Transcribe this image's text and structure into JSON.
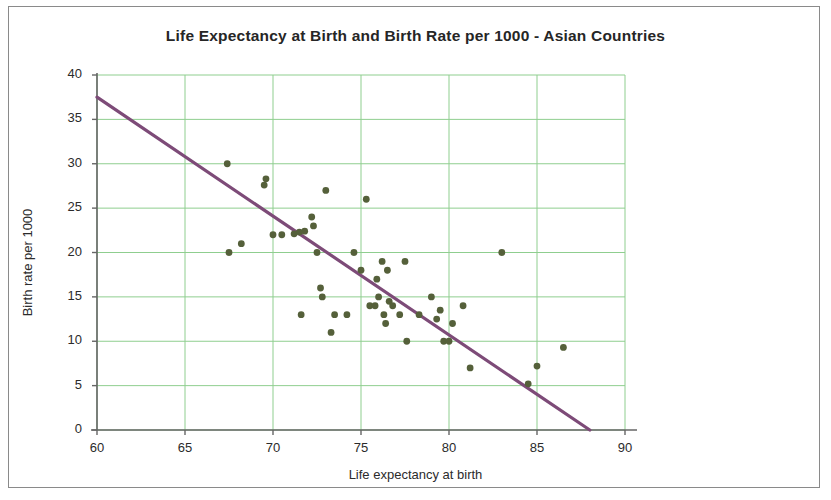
{
  "chart_data": {
    "type": "scatter",
    "title": "Life Expectancy at Birth and Birth Rate per 1000 - Asian Countries",
    "xlabel": "Life expectancy at birth",
    "ylabel": "Birth rate per 1000",
    "xlim": [
      60,
      90
    ],
    "ylim": [
      0,
      40
    ],
    "xticks": [
      60,
      65,
      70,
      75,
      80,
      85,
      90
    ],
    "yticks": [
      0,
      5,
      10,
      15,
      20,
      25,
      30,
      35,
      40
    ],
    "grid": true,
    "legend": null,
    "marker_color": "#55603a",
    "trendline_color": "#7d4b78",
    "grid_color": "#8fce8f",
    "axis_color": "#666666",
    "series": [
      {
        "name": "Asian Countries",
        "points": [
          [
            67.4,
            30.0
          ],
          [
            67.5,
            20.0
          ],
          [
            68.2,
            21.0
          ],
          [
            69.5,
            27.6
          ],
          [
            69.6,
            28.3
          ],
          [
            70.0,
            22.0
          ],
          [
            70.5,
            22.0
          ],
          [
            71.2,
            22.1
          ],
          [
            71.5,
            22.3
          ],
          [
            71.8,
            22.4
          ],
          [
            71.6,
            13.0
          ],
          [
            72.2,
            24.0
          ],
          [
            72.3,
            23.0
          ],
          [
            72.5,
            20.0
          ],
          [
            72.7,
            16.0
          ],
          [
            72.8,
            15.0
          ],
          [
            73.0,
            27.0
          ],
          [
            73.3,
            11.0
          ],
          [
            73.5,
            13.0
          ],
          [
            74.2,
            13.0
          ],
          [
            74.6,
            20.0
          ],
          [
            75.0,
            18.0
          ],
          [
            75.3,
            26.0
          ],
          [
            75.5,
            14.0
          ],
          [
            75.8,
            14.0
          ],
          [
            75.9,
            17.0
          ],
          [
            76.0,
            15.0
          ],
          [
            76.2,
            19.0
          ],
          [
            76.3,
            13.0
          ],
          [
            76.4,
            12.0
          ],
          [
            76.5,
            18.0
          ],
          [
            76.6,
            14.5
          ],
          [
            76.8,
            14.0
          ],
          [
            77.2,
            13.0
          ],
          [
            77.5,
            19.0
          ],
          [
            77.6,
            10.0
          ],
          [
            78.3,
            13.0
          ],
          [
            79.0,
            15.0
          ],
          [
            79.3,
            12.5
          ],
          [
            79.5,
            13.5
          ],
          [
            79.7,
            10.0
          ],
          [
            80.0,
            10.0
          ],
          [
            80.2,
            12.0
          ],
          [
            80.8,
            14.0
          ],
          [
            81.2,
            7.0
          ],
          [
            83.0,
            20.0
          ],
          [
            84.5,
            5.2
          ],
          [
            85.0,
            7.2
          ],
          [
            86.5,
            9.3
          ]
        ]
      }
    ],
    "trendline": {
      "x": [
        60,
        88
      ],
      "y": [
        37.5,
        0
      ]
    }
  }
}
